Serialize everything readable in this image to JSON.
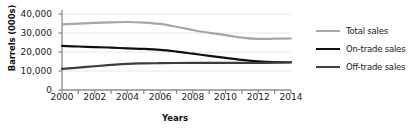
{
  "chart_data": {
    "type": "line",
    "title": "",
    "xlabel": "Years",
    "ylabel": "Barrels (000s)",
    "x": [
      2000,
      2001,
      2002,
      2003,
      2004,
      2005,
      2006,
      2007,
      2008,
      2009,
      2010,
      2011,
      2012,
      2013,
      2014
    ],
    "xlim": [
      2000,
      2014
    ],
    "ylim": [
      0,
      40000
    ],
    "yticks": [
      0,
      10000,
      20000,
      30000,
      40000
    ],
    "ytick_labels": [
      "0",
      "10,000",
      "20,000",
      "30,000",
      "40,000"
    ],
    "xtick_labels": [
      "2000",
      "2002",
      "2004",
      "2006",
      "2008",
      "2010",
      "2012",
      "2014"
    ],
    "xticks_minor_every": 1,
    "grid": true,
    "grid_axis": "y",
    "legend_position": "right",
    "series": [
      {
        "name": "Total sales",
        "color": "#a6a6a6",
        "width": 2.2,
        "values": [
          34500,
          34900,
          35300,
          35600,
          35800,
          35500,
          34800,
          33300,
          31600,
          30100,
          28900,
          27600,
          26900,
          27000,
          27100
        ]
      },
      {
        "name": "On-trade sales",
        "color": "#111111",
        "width": 2.2,
        "values": [
          23200,
          22900,
          22600,
          22300,
          21900,
          21600,
          21100,
          20200,
          19100,
          18000,
          16900,
          15900,
          15100,
          14700,
          14600
        ]
      },
      {
        "name": "Off-trade sales",
        "color": "#3d3d3d",
        "width": 2.2,
        "values": [
          11100,
          11800,
          12500,
          13200,
          13800,
          14000,
          14100,
          14200,
          14300,
          14300,
          14300,
          14300,
          14200,
          14400,
          14500
        ]
      }
    ]
  },
  "axis": {
    "line_color": "#8c8c8c",
    "grid_color": "#e8e8e8"
  },
  "legend": {
    "entries": [
      {
        "label": "Total sales"
      },
      {
        "label": "On-trade sales"
      },
      {
        "label": "Off-trade sales"
      }
    ]
  }
}
